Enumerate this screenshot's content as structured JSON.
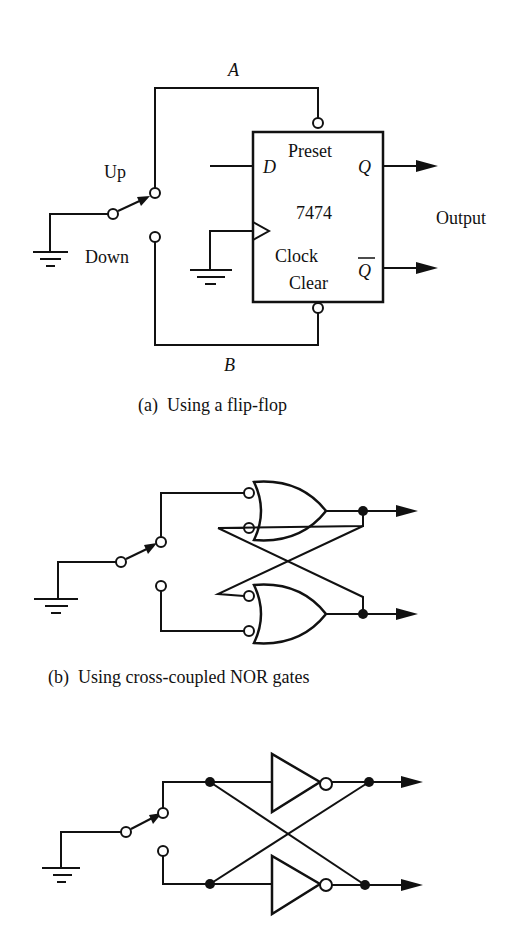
{
  "figure_a": {
    "caption": "(a)  Using a flip-flop",
    "node_top": "A",
    "node_bottom": "B",
    "switch_up": "Up",
    "switch_down": "Down",
    "chip": "7474",
    "pin_preset": "Preset",
    "pin_d": "D",
    "pin_q": "Q",
    "pin_clock": "Clock",
    "pin_clear": "Clear",
    "pin_qbar": "Q",
    "output": "Output"
  },
  "figure_b": {
    "caption": "(b)  Using cross-coupled NOR gates"
  },
  "figure_c": {}
}
